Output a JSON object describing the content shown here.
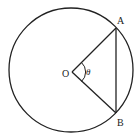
{
  "diagram": {
    "type": "circle-geometry",
    "labels": {
      "center": "O",
      "point_a": "A",
      "point_b": "B",
      "angle": "θ"
    },
    "colors": {
      "stroke": "#222222",
      "background": "#ffffff"
    }
  }
}
